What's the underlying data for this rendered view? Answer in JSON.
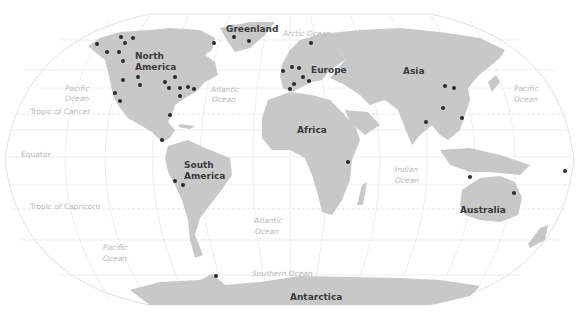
{
  "map": {
    "projection": "Robinson",
    "colors": {
      "land": "#c8c8c8",
      "ocean": "#ffffff",
      "graticule": "#e6e6e6",
      "marker": "#2a2a2a",
      "continent_label": "#3a3a3a",
      "ocean_label": "#b9b9b9"
    },
    "continent_labels": [
      {
        "name": "Greenland",
        "x": 226,
        "y": 32
      },
      {
        "name": "North",
        "x": 135,
        "y": 59
      },
      {
        "name": "America",
        "x": 135,
        "y": 70
      },
      {
        "name": "Europe",
        "x": 311,
        "y": 73
      },
      {
        "name": "Asia",
        "x": 403,
        "y": 74
      },
      {
        "name": "Africa",
        "x": 297,
        "y": 133
      },
      {
        "name": "South",
        "x": 184,
        "y": 168
      },
      {
        "name": "America",
        "x": 184,
        "y": 179
      },
      {
        "name": "Australia",
        "x": 460,
        "y": 213
      },
      {
        "name": "Antarctica",
        "x": 290,
        "y": 300
      }
    ],
    "ocean_labels": [
      {
        "name": "Arctic Ocean",
        "x": 283,
        "y": 36
      },
      {
        "name": "Pacific",
        "x": 65,
        "y": 91
      },
      {
        "name": "Ocean",
        "x": 65,
        "y": 101
      },
      {
        "name": "Atlantic",
        "x": 211,
        "y": 92
      },
      {
        "name": "Ocean",
        "x": 212,
        "y": 102
      },
      {
        "name": "Pacific",
        "x": 514,
        "y": 91
      },
      {
        "name": "Ocean",
        "x": 514,
        "y": 102
      },
      {
        "name": "Indian",
        "x": 395,
        "y": 172
      },
      {
        "name": "Ocean",
        "x": 395,
        "y": 183
      },
      {
        "name": "Atlantic",
        "x": 254,
        "y": 223
      },
      {
        "name": "Ocean",
        "x": 255,
        "y": 234
      },
      {
        "name": "Pacific",
        "x": 103,
        "y": 250
      },
      {
        "name": "Ocean",
        "x": 103,
        "y": 261
      },
      {
        "name": "Southern Ocean",
        "x": 252,
        "y": 276
      }
    ],
    "reference_lines": [
      {
        "name": "Tropic of Cancer",
        "x": 30,
        "y": 114
      },
      {
        "name": "Equator",
        "x": 21,
        "y": 157
      },
      {
        "name": "Tropic of Capricorn",
        "x": 30,
        "y": 209
      }
    ],
    "markers": [
      {
        "x": 97,
        "y": 44
      },
      {
        "x": 121,
        "y": 37
      },
      {
        "x": 125,
        "y": 43
      },
      {
        "x": 133,
        "y": 38
      },
      {
        "x": 107,
        "y": 52
      },
      {
        "x": 119,
        "y": 52
      },
      {
        "x": 123,
        "y": 61
      },
      {
        "x": 123,
        "y": 80
      },
      {
        "x": 138,
        "y": 77
      },
      {
        "x": 140,
        "y": 85
      },
      {
        "x": 115,
        "y": 93
      },
      {
        "x": 120,
        "y": 101
      },
      {
        "x": 165,
        "y": 82
      },
      {
        "x": 175,
        "y": 77
      },
      {
        "x": 169,
        "y": 88
      },
      {
        "x": 180,
        "y": 88
      },
      {
        "x": 188,
        "y": 87
      },
      {
        "x": 194,
        "y": 89
      },
      {
        "x": 180,
        "y": 96
      },
      {
        "x": 170,
        "y": 115
      },
      {
        "x": 162,
        "y": 140
      },
      {
        "x": 214,
        "y": 43
      },
      {
        "x": 234,
        "y": 37
      },
      {
        "x": 249,
        "y": 41
      },
      {
        "x": 311,
        "y": 43
      },
      {
        "x": 283,
        "y": 71
      },
      {
        "x": 292,
        "y": 67
      },
      {
        "x": 299,
        "y": 68
      },
      {
        "x": 303,
        "y": 77
      },
      {
        "x": 309,
        "y": 81
      },
      {
        "x": 294,
        "y": 84
      },
      {
        "x": 290,
        "y": 89
      },
      {
        "x": 445,
        "y": 86
      },
      {
        "x": 454,
        "y": 88
      },
      {
        "x": 443,
        "y": 108
      },
      {
        "x": 462,
        "y": 118
      },
      {
        "x": 426,
        "y": 122
      },
      {
        "x": 348,
        "y": 162
      },
      {
        "x": 470,
        "y": 177
      },
      {
        "x": 514,
        "y": 193
      },
      {
        "x": 565,
        "y": 171
      },
      {
        "x": 175,
        "y": 181
      },
      {
        "x": 183,
        "y": 185
      },
      {
        "x": 216,
        "y": 276
      }
    ]
  }
}
